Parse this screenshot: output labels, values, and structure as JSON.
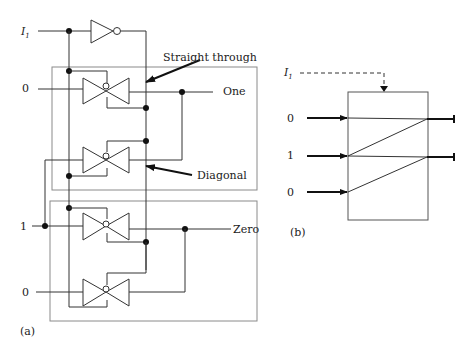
{
  "figure_a": {
    "label": "(a)",
    "control_input": {
      "name": "I",
      "subscript": "1"
    },
    "inputs": [
      "0",
      "1",
      "0"
    ],
    "outputs": [
      "One",
      "Zero"
    ],
    "annotations": {
      "straight_through": "Straight through",
      "diagonal": "Diagonal"
    }
  },
  "figure_b": {
    "label": "(b)",
    "control_input": {
      "name": "I",
      "subscript": "1"
    },
    "inputs": [
      "0",
      "1",
      "0"
    ]
  }
}
